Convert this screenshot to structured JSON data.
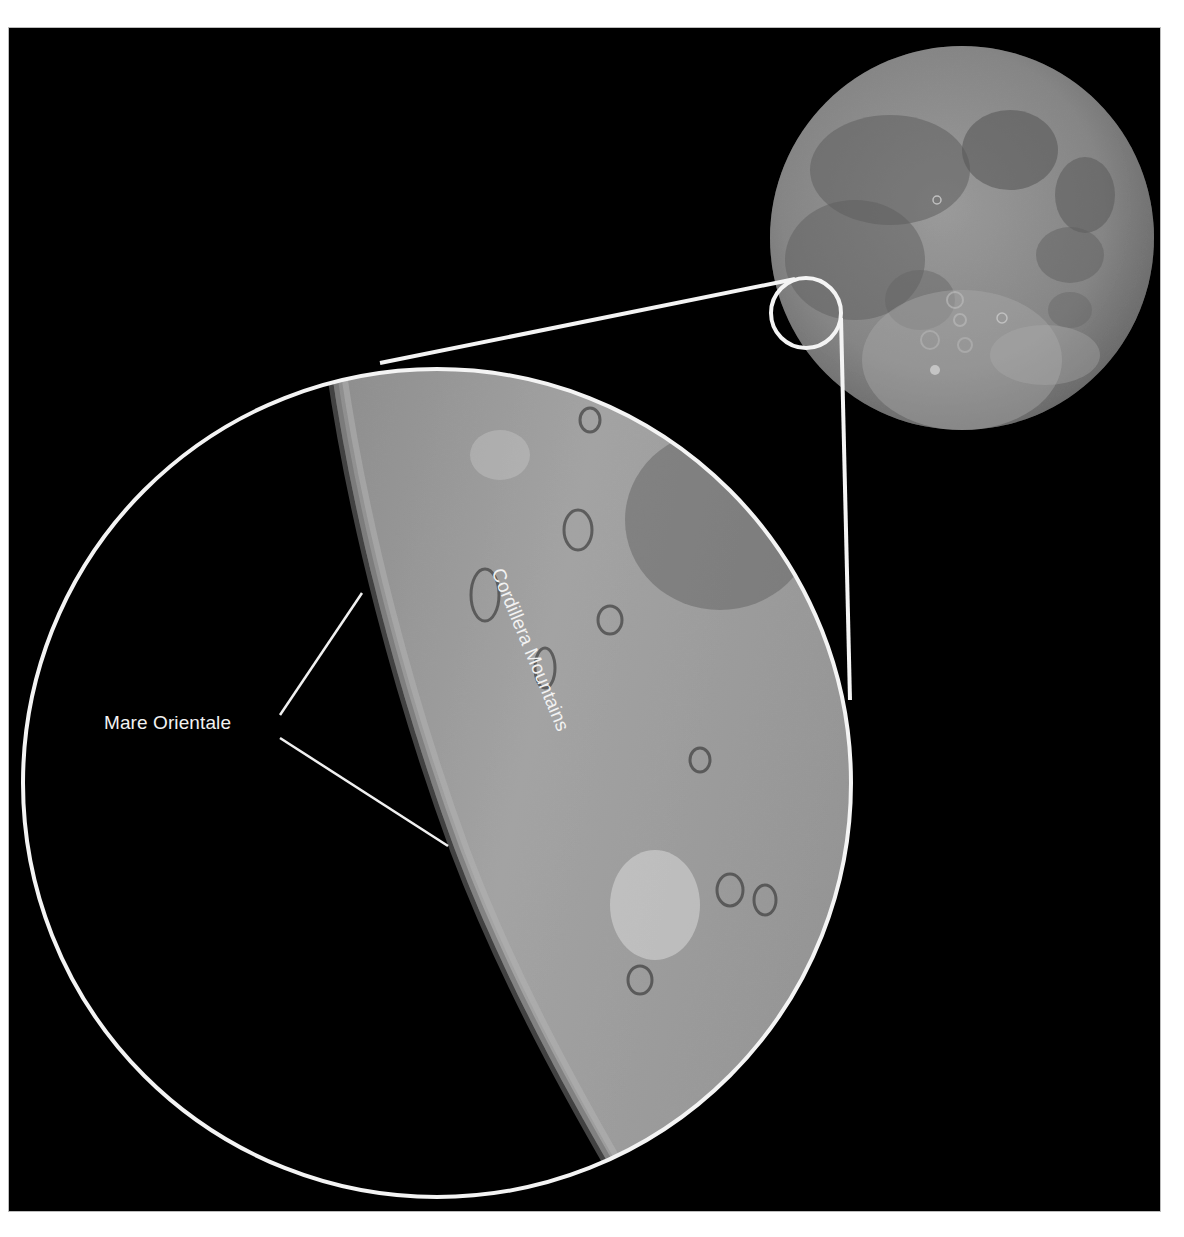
{
  "figure": {
    "background_color": "#000000",
    "page_color": "#ffffff",
    "callout_color": "#f4f4f4"
  },
  "labels": {
    "mare_orientale": "Mare Orientale",
    "cordillera_mountains": "Cordillera Mountains"
  },
  "elements": {
    "moon": {
      "cx": 962,
      "cy": 238,
      "r": 192
    },
    "callout_small_circle": {
      "cx": 806,
      "cy": 313,
      "r": 35
    },
    "inset_circle": {
      "cx": 437,
      "cy": 783,
      "r": 416
    }
  }
}
